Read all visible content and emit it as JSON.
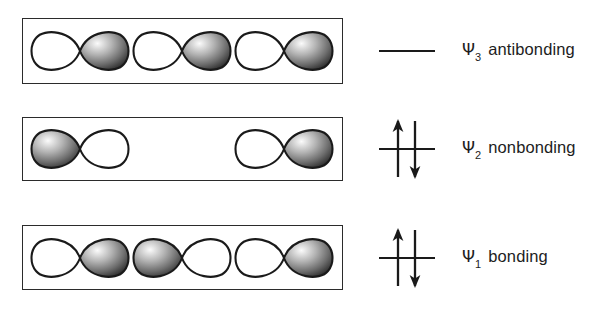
{
  "diagram": {
    "colors": {
      "box_border": "#2b2b2b",
      "lobe_outline": "#1a1a1a",
      "lobe_empty_fill": "#ffffff",
      "lobe_shaded_light": "#f2f2f2",
      "lobe_shaded_mid": "#8a8a8a",
      "lobe_shaded_dark": "#2e2e2e",
      "arrow": "#1a1a1a",
      "text": "#1d1d1d",
      "background": "#ffffff"
    },
    "levels": [
      {
        "id": "psi3",
        "psi_symbol": "Ψ",
        "subscript": "3",
        "term": "antibonding",
        "electrons": 0,
        "arrows": [],
        "nodes": 2,
        "orbitals": [
          {
            "present": true,
            "left_lobe": "empty",
            "right_lobe": "shaded"
          },
          {
            "present": true,
            "left_lobe": "empty",
            "right_lobe": "shaded"
          },
          {
            "present": true,
            "left_lobe": "empty",
            "right_lobe": "shaded"
          }
        ]
      },
      {
        "id": "psi2",
        "psi_symbol": "Ψ",
        "subscript": "2",
        "term": "nonbonding",
        "electrons": 2,
        "arrows": [
          "up",
          "down"
        ],
        "nodes": 1,
        "orbitals": [
          {
            "present": true,
            "left_lobe": "shaded",
            "right_lobe": "empty"
          },
          {
            "present": false,
            "left_lobe": "none",
            "right_lobe": "none"
          },
          {
            "present": true,
            "left_lobe": "empty",
            "right_lobe": "shaded"
          }
        ]
      },
      {
        "id": "psi1",
        "psi_symbol": "Ψ",
        "subscript": "1",
        "term": "bonding",
        "electrons": 2,
        "arrows": [
          "up",
          "down"
        ],
        "nodes": 0,
        "orbitals": [
          {
            "present": true,
            "left_lobe": "empty",
            "right_lobe": "shaded"
          },
          {
            "present": true,
            "left_lobe": "shaded",
            "right_lobe": "empty"
          },
          {
            "present": true,
            "left_lobe": "empty",
            "right_lobe": "shaded"
          }
        ]
      }
    ]
  }
}
